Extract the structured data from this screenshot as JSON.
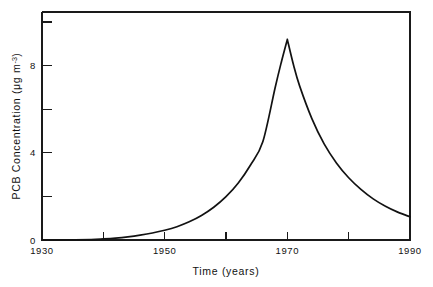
{
  "chart_data": {
    "type": "line",
    "title": "",
    "xlabel": "Time (years)",
    "ylabel": "PCB Concentration (μg m⁻³)",
    "ylabel_main": "PCB Concentration (",
    "ylabel_unit_mu": "μg m",
    "ylabel_unit_exp": "-3",
    "ylabel_close": ")",
    "xlim": [
      1930,
      1990
    ],
    "ylim": [
      0,
      10.8
    ],
    "grid": false,
    "legend": null,
    "xticks_major": [
      1930,
      1950,
      1970,
      1990
    ],
    "xtick_labels": [
      "1930",
      "1950",
      "1970",
      "1990"
    ],
    "xticks_minor": [
      1940,
      1960,
      1980
    ],
    "yticks_major": [
      0,
      4,
      8
    ],
    "ytick_labels": [
      "0",
      "4",
      "8"
    ],
    "yticks_minor": [
      2,
      6,
      10
    ],
    "series": [
      {
        "name": "PCB Concentration",
        "x": [
          1930,
          1934,
          1938,
          1940,
          1942,
          1944,
          1946,
          1948,
          1950,
          1952,
          1954,
          1956,
          1958,
          1960,
          1962,
          1964,
          1966,
          1968,
          1969,
          1970,
          1971,
          1972,
          1974,
          1976,
          1978,
          1980,
          1982,
          1984,
          1986,
          1988,
          1990
        ],
        "values": [
          0.0,
          0.0,
          0.02,
          0.05,
          0.09,
          0.15,
          0.23,
          0.33,
          0.46,
          0.63,
          0.86,
          1.16,
          1.55,
          2.05,
          2.7,
          3.55,
          4.65,
          7.2,
          8.4,
          9.5,
          8.3,
          7.3,
          5.75,
          4.55,
          3.65,
          2.95,
          2.4,
          1.95,
          1.6,
          1.32,
          1.1
        ]
      }
    ],
    "peak": {
      "x": 1970,
      "y": 9.5
    },
    "annotations": []
  },
  "axes": {
    "x_title": "Time (years)",
    "y_title_prefix": "PCB Concentration (",
    "y_title_unit": "μg m",
    "y_title_exponent": "-3",
    "y_title_suffix": ")"
  },
  "colors": {
    "curve": "#121212",
    "axis": "#1a1a1a",
    "text": "#111111",
    "background": "#ffffff"
  }
}
